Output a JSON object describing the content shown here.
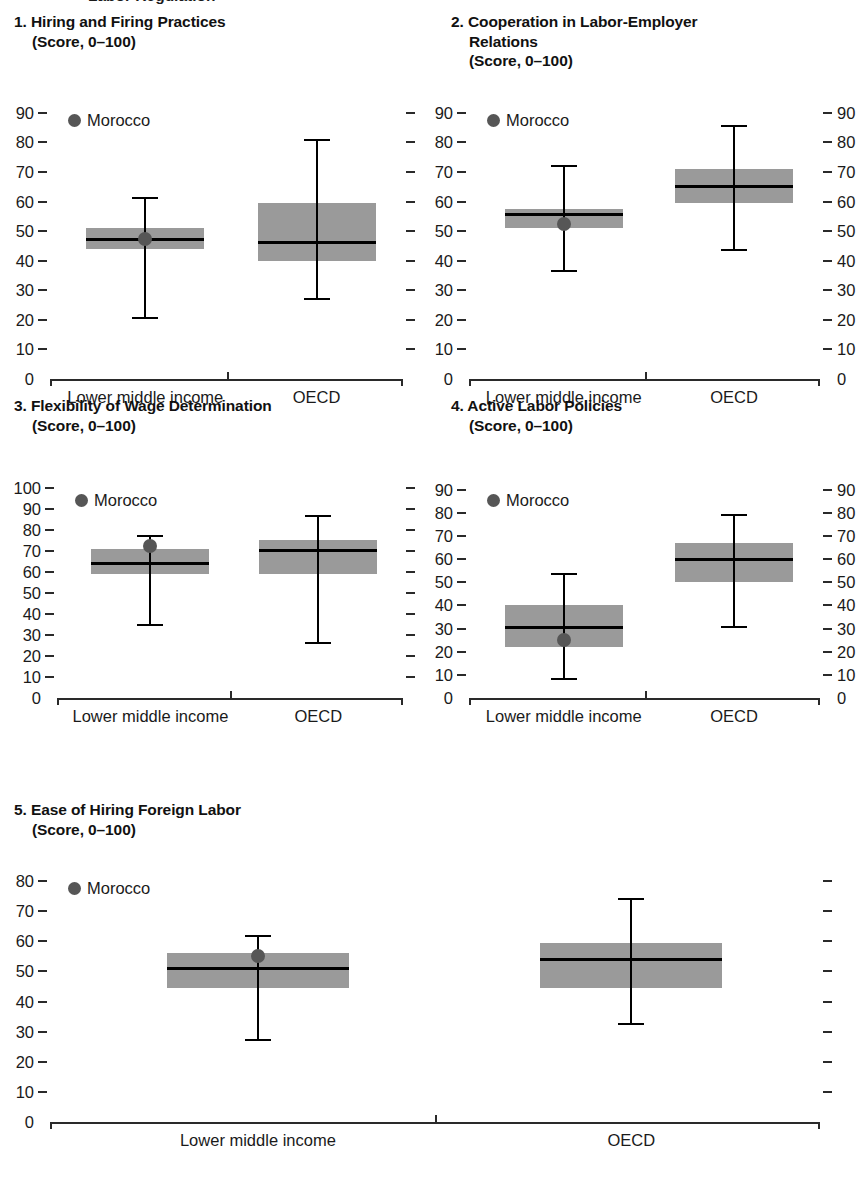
{
  "figure": {
    "cropped_header": "Labor Regulation",
    "group_labels": [
      "Lower middle income",
      "OECD"
    ],
    "legend_label": "Morocco",
    "marker_color": "#565656",
    "box_color": "#9a9a9a",
    "line_color": "#000000"
  },
  "chart_data": [
    {
      "type": "box",
      "index": "1.",
      "title": "1. Hiring and Firing Practices\n(Score, 0–100)",
      "title_line1": "1. Hiring and Firing Practices",
      "title_line2": "(Score, 0–100)",
      "ylabel": "Score, 0–100",
      "ylim": [
        0,
        95
      ],
      "yticks": [
        0,
        10,
        20,
        30,
        40,
        50,
        60,
        70,
        80,
        90
      ],
      "ytick_labels": [
        "0",
        "10",
        "20",
        "30",
        "40",
        "50",
        "60",
        "70",
        "80",
        "90"
      ],
      "right_axis_labeled": false,
      "categories": [
        "Lower middle income",
        "OECD"
      ],
      "boxes": [
        {
          "category": "Lower middle income",
          "q1": 44,
          "median": 47,
          "q3": 51,
          "whisker_low": 21,
          "whisker_high": 61.5
        },
        {
          "category": "OECD",
          "q1": 40,
          "median": 46,
          "q3": 59.5,
          "whisker_low": 27.5,
          "whisker_high": 81
        }
      ],
      "marker": {
        "label": "Morocco",
        "category": "Lower middle income",
        "value": 47.5
      }
    },
    {
      "type": "box",
      "index": "2.",
      "title": "2. Cooperation in Labor-Employer\nRelations\n(Score, 0–100)",
      "title_line1": "2. Cooperation in Labor-Employer",
      "title_line2": "Relations",
      "title_line3": "(Score, 0–100)",
      "ylabel": "Score, 0–100",
      "ylim": [
        0,
        95
      ],
      "yticks": [
        0,
        10,
        20,
        30,
        40,
        50,
        60,
        70,
        80,
        90
      ],
      "ytick_labels": [
        "0",
        "10",
        "20",
        "30",
        "40",
        "50",
        "60",
        "70",
        "80",
        "90"
      ],
      "right_axis_labeled": true,
      "categories": [
        "Lower middle income",
        "OECD"
      ],
      "boxes": [
        {
          "category": "Lower middle income",
          "q1": 51,
          "median": 55.5,
          "q3": 57.5,
          "whisker_low": 37,
          "whisker_high": 72.5
        },
        {
          "category": "OECD",
          "q1": 59.5,
          "median": 65,
          "q3": 71,
          "whisker_low": 44,
          "whisker_high": 86
        }
      ],
      "marker": {
        "label": "Morocco",
        "category": "Lower middle income",
        "value": 52.5
      }
    },
    {
      "type": "box",
      "index": "3.",
      "title": "3. Flexibility of Wage Determination\n(Score, 0–100)",
      "title_line1": "3. Flexibility of Wage Determination",
      "title_line2": "(Score, 0–100)",
      "ylabel": "Score, 0–100",
      "ylim": [
        0,
        105
      ],
      "yticks": [
        0,
        10,
        20,
        30,
        40,
        50,
        60,
        70,
        80,
        90,
        100
      ],
      "ytick_labels": [
        "0",
        "10",
        "20",
        "30",
        "40",
        "50",
        "60",
        "70",
        "80",
        "90",
        "100"
      ],
      "right_axis_labeled": false,
      "categories": [
        "Lower middle income",
        "OECD"
      ],
      "boxes": [
        {
          "category": "Lower middle income",
          "q1": 59,
          "median": 64,
          "q3": 71,
          "whisker_low": 35.5,
          "whisker_high": 78
        },
        {
          "category": "OECD",
          "q1": 59,
          "median": 70.5,
          "q3": 75.5,
          "whisker_low": 26.5,
          "whisker_high": 87.5
        }
      ],
      "marker": {
        "label": "Morocco",
        "category": "Lower middle income",
        "value": 72.5
      }
    },
    {
      "type": "box",
      "index": "4.",
      "title": "4. Active Labor Policies\n(Score, 0–100)",
      "title_line1": "4. Active Labor Policies",
      "title_line2": "(Score, 0–100)",
      "ylabel": "Score, 0–100",
      "ylim": [
        0,
        95
      ],
      "yticks": [
        0,
        10,
        20,
        30,
        40,
        50,
        60,
        70,
        80,
        90
      ],
      "ytick_labels": [
        "0",
        "10",
        "20",
        "30",
        "40",
        "50",
        "60",
        "70",
        "80",
        "90"
      ],
      "right_axis_labeled": true,
      "categories": [
        "Lower middle income",
        "OECD"
      ],
      "boxes": [
        {
          "category": "Lower middle income",
          "q1": 22,
          "median": 30.5,
          "q3": 40,
          "whisker_low": 8.5,
          "whisker_high": 54
        },
        {
          "category": "OECD",
          "q1": 50,
          "median": 60,
          "q3": 67,
          "whisker_low": 31,
          "whisker_high": 79.5
        }
      ],
      "marker": {
        "label": "Morocco",
        "category": "Lower middle income",
        "value": 25
      }
    },
    {
      "type": "box",
      "index": "5.",
      "title": "5. Ease of Hiring Foreign Labor\n(Score, 0–100)",
      "title_line1": "5. Ease of Hiring Foreign Labor",
      "title_line2": "(Score, 0–100)",
      "ylabel": "Score, 0–100",
      "ylim": [
        0,
        85
      ],
      "yticks": [
        0,
        10,
        20,
        30,
        40,
        50,
        60,
        70,
        80
      ],
      "ytick_labels": [
        "0",
        "10",
        "20",
        "30",
        "40",
        "50",
        "60",
        "70",
        "80"
      ],
      "right_axis_labeled": false,
      "categories": [
        "Lower middle income",
        "OECD"
      ],
      "boxes": [
        {
          "category": "Lower middle income",
          "q1": 44.5,
          "median": 51,
          "q3": 56,
          "whisker_low": 27.5,
          "whisker_high": 62
        },
        {
          "category": "OECD",
          "q1": 44.5,
          "median": 54,
          "q3": 59.5,
          "whisker_low": 33,
          "whisker_high": 74.5
        }
      ],
      "marker": {
        "label": "Morocco",
        "category": "Lower middle income",
        "value": 55
      }
    }
  ]
}
